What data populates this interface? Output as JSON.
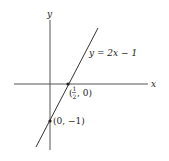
{
  "diagram": {
    "title": "",
    "axes": {
      "x_label": "x",
      "y_label": "y"
    },
    "line": {
      "equation": "y = 2x − 1"
    },
    "points": [
      {
        "label_num": "1",
        "label_den": "2",
        "label_rest": ", 0)",
        "label_open": "(",
        "desc": "x-intercept"
      },
      {
        "label": "(0, −1)",
        "desc": "y-intercept"
      }
    ],
    "colors": {
      "line": "#333333",
      "axes": "#555555",
      "background": "#ffffff"
    }
  }
}
